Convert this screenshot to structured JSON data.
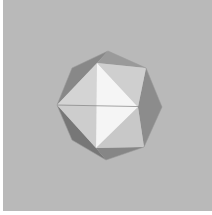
{
  "scene": {
    "subject": "octahedron rendered in gray shading",
    "colors": {
      "background": "#b9b9b9",
      "border": "#ffffff",
      "face_bright": "#f4f4f4",
      "face_light": "#d2d2d2",
      "face_mid": "#a9a9a9",
      "face_dark": "#7e7e7e",
      "edge": "#8a8a8a"
    }
  }
}
